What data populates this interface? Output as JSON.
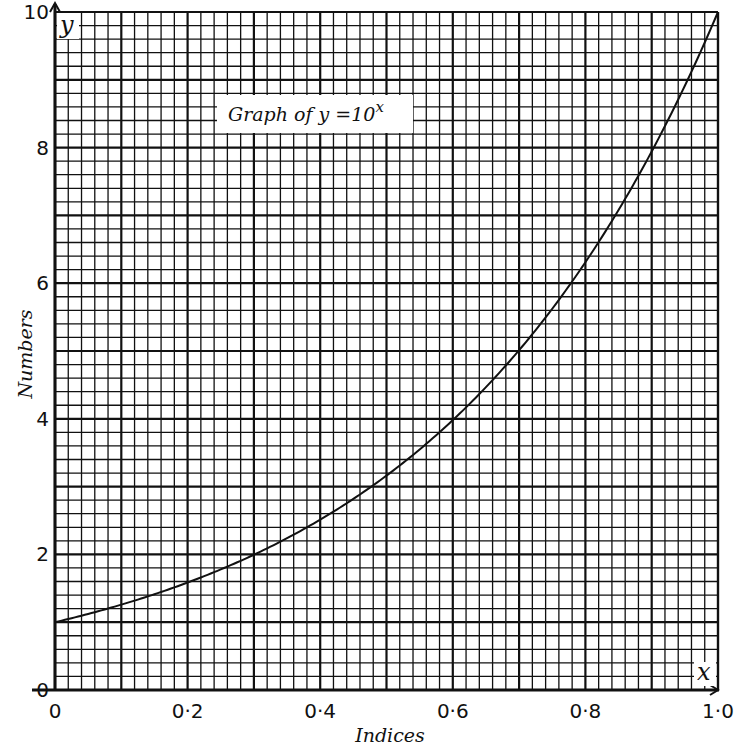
{
  "chart_data": {
    "type": "line",
    "title_parts": {
      "main": "Graph of y = 10",
      "superscript": "x"
    },
    "xlabel": "Indices",
    "ylabel": "Numbers",
    "x_var": "x",
    "y_var": "y",
    "xlim": [
      0,
      1.0
    ],
    "ylim": [
      0,
      10
    ],
    "x_ticks": [
      0,
      0.2,
      0.4,
      0.6,
      0.8,
      1.0
    ],
    "x_tick_labels": [
      "0",
      "0·2",
      "0·4",
      "0·6",
      "0·8",
      "1·0"
    ],
    "y_ticks": [
      0,
      2,
      4,
      6,
      8,
      10
    ],
    "y_tick_labels": [
      "0",
      "2",
      "4",
      "6",
      "8",
      "10"
    ],
    "grid": {
      "on": true,
      "minor_x_step": 0.02,
      "minor_y_step": 0.2,
      "major_every": 5
    },
    "legend": null,
    "series": [
      {
        "name": "y = 10^x",
        "x": [
          0,
          0.1,
          0.2,
          0.3,
          0.4,
          0.5,
          0.6,
          0.7,
          0.8,
          0.9,
          1.0
        ],
        "y": [
          1.0,
          1.26,
          1.58,
          2.0,
          2.51,
          3.16,
          3.98,
          5.01,
          6.31,
          7.94,
          10.0
        ]
      }
    ],
    "colors": {
      "ink": "#111111",
      "paper": "#ffffff"
    }
  },
  "labels": {
    "title_main": "Graph of y =10",
    "title_sup": "x",
    "xlabel": "Indices",
    "ylabel": "Numbers",
    "x_var": "x",
    "y_var": "y"
  }
}
